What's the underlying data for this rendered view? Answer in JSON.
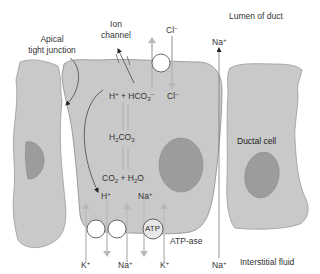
{
  "regions": {
    "lumen": "Lumen of duct",
    "interstitial": "Interstitial fluid"
  },
  "labels": {
    "apical_tight_junction_1": "Apical",
    "apical_tight_junction_2": "tight junction",
    "ion_channel_1": "Ion",
    "ion_channel_2": "channel",
    "ductal_cell": "Ductal cell",
    "atp_ase": "ATP-ase",
    "atp": "ATP"
  },
  "ions": {
    "cl_top": "Cl",
    "cl_top_charge": "−",
    "cl_inside": "Cl",
    "cl_inside_charge": "−",
    "na_lumen": "Na",
    "na_lumen_charge": "+",
    "na_bottom_right": "Na",
    "na_bottom_right_charge": "+",
    "k_left": "K",
    "k_left_charge": "+",
    "na_bottom_mid": "Na",
    "na_bottom_mid_charge": "+",
    "k_right": "K",
    "k_right_charge": "+",
    "h_inside": "H",
    "h_inside_charge": "+",
    "na_inside": "Na",
    "na_inside_charge": "+"
  },
  "reactions": {
    "dissociation": {
      "h": "H",
      "h_charge": "+",
      "plus": " + ",
      "hco": "HCO",
      "hco_sub": "3",
      "hco_charge": "−"
    },
    "carbonic_acid": {
      "h": "H",
      "h_sub": "2",
      "co": "CO",
      "co_sub": "3"
    },
    "formation": {
      "co": "CO",
      "co_sub": "2",
      "plus": " + ",
      "h": "H",
      "h_sub": "2",
      "o": "O"
    }
  },
  "colors": {
    "cell_fill": "#c9c9c9",
    "cell_stroke": "#8a8a8a",
    "nucleus_fill": "#9a9a9a",
    "arrow_gray": "#b3b3b3",
    "text": "#333333"
  }
}
